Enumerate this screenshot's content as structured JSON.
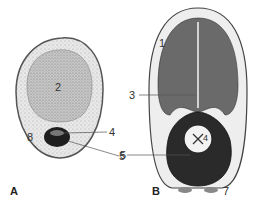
{
  "figure": {
    "panels": [
      {
        "id": "A",
        "label": "A"
      },
      {
        "id": "B",
        "label": "B"
      }
    ],
    "panel_a": {
      "labels": {
        "n2": "2",
        "n4": "4",
        "n5": "5",
        "n8": "8"
      }
    },
    "panel_b": {
      "labels": {
        "n1": "1",
        "n3": "3",
        "n4": "4",
        "n5": "5",
        "n7": "7"
      }
    },
    "colors": {
      "outline": "#444444",
      "stipple_light": "#e6e6e6",
      "stipple_mid": "#b8b8b8",
      "dark": "#222222",
      "cotyledon": "#6a6a6a"
    }
  }
}
